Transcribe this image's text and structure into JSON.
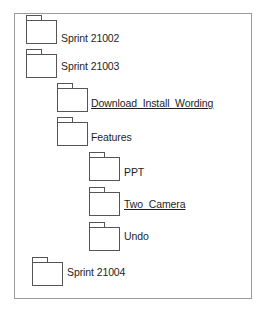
{
  "diagram": {
    "type": "folder-tree",
    "nodes": [
      {
        "label": "Sprint 21002",
        "level": 0,
        "underlined": false
      },
      {
        "label": "Sprint 21003",
        "level": 0,
        "underlined": false
      },
      {
        "label": "Download_Install_Wording",
        "level": 1,
        "underlined": true
      },
      {
        "label": "Features",
        "level": 1,
        "underlined": false
      },
      {
        "label": "PPT",
        "level": 2,
        "underlined": false
      },
      {
        "label": "Two_Camera",
        "level": 2,
        "underlined": true
      },
      {
        "label": "Undo",
        "level": 2,
        "underlined": false
      },
      {
        "label": "Sprint 21004",
        "level": 0,
        "underlined": false
      }
    ]
  },
  "colors": {
    "border": "#9a9a9a",
    "folder_stroke": "#555555",
    "text": "#1e1e1e"
  }
}
